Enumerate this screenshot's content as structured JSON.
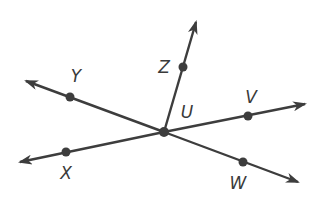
{
  "diagram": {
    "type": "geometry-rays",
    "colors": {
      "stroke": "#3d3d3d",
      "point": "#3d3d3d",
      "label": "#3a3a3a",
      "background": "#ffffff"
    },
    "center": {
      "name": "U",
      "x": 164,
      "y": 132,
      "label_x": 187,
      "label_y": 112
    },
    "points": [
      {
        "name": "Z",
        "x": 183,
        "y": 67,
        "label_x": 164,
        "label_y": 67
      },
      {
        "name": "Y",
        "x": 70,
        "y": 97,
        "label_x": 76,
        "label_y": 76
      },
      {
        "name": "V",
        "x": 248,
        "y": 116,
        "label_x": 251,
        "label_y": 97
      },
      {
        "name": "X",
        "x": 66,
        "y": 152,
        "label_x": 66,
        "label_y": 173
      },
      {
        "name": "W",
        "x": 243,
        "y": 162,
        "label_x": 238,
        "label_y": 183
      }
    ],
    "rays": [
      {
        "name": "ray-UZ",
        "from": [
          164,
          132
        ],
        "to": [
          196,
          22
        ]
      },
      {
        "name": "ray-UY",
        "from": [
          164,
          132
        ],
        "to": [
          26,
          81
        ]
      },
      {
        "name": "ray-UV",
        "from": [
          164,
          132
        ],
        "to": [
          305,
          104
        ]
      },
      {
        "name": "ray-UX",
        "from": [
          164,
          132
        ],
        "to": [
          20,
          162
        ]
      },
      {
        "name": "ray-UW",
        "from": [
          164,
          132
        ],
        "to": [
          298,
          182
        ]
      }
    ],
    "labels": {
      "U": "U",
      "Z": "Z",
      "Y": "Y",
      "V": "V",
      "X": "X",
      "W": "W"
    }
  }
}
